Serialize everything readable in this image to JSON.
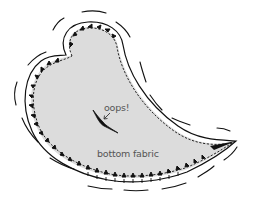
{
  "diagram": {
    "labels": {
      "oops": "oops!",
      "bottom_fabric": "bottom fabric"
    },
    "colors": {
      "fabric_fill": "#dcdcdc",
      "ink": "#111111",
      "label_text": "#555555",
      "background": "#ffffff"
    },
    "elements": [
      {
        "id": "fabric-shape",
        "type": "paisley",
        "fill": "bottom fabric"
      },
      {
        "id": "stitch-line",
        "type": "dashed seam line"
      },
      {
        "id": "clip-notches",
        "type": "V-shaped clips in seam allowance"
      },
      {
        "id": "motion-lines",
        "type": "curved strokes around outline"
      },
      {
        "id": "mistake-mark",
        "type": "accidental cut",
        "annotation": "oops!"
      }
    ]
  }
}
